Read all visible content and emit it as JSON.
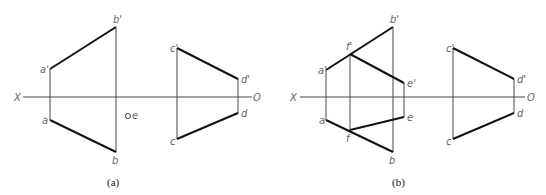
{
  "figures": [
    {
      "id": "a",
      "caption": "(a)",
      "axis": {
        "left": "X",
        "right": "O"
      },
      "points": {
        "a_prime": "a'",
        "b_prime": "b'",
        "a": "a",
        "b": "b",
        "c_prime": "c'",
        "d_prime": "d'",
        "c": "c",
        "d": "d",
        "e": "e"
      }
    },
    {
      "id": "b",
      "caption": "(b)",
      "axis": {
        "left": "X",
        "right": "O"
      },
      "points": {
        "a_prime": "a'",
        "b_prime": "b'",
        "f_prime": "f'",
        "e_prime": "e'",
        "a": "a",
        "b": "b",
        "f": "f",
        "e": "e",
        "c_prime": "c'",
        "d_prime": "d'",
        "c": "c",
        "d": "d"
      }
    }
  ]
}
